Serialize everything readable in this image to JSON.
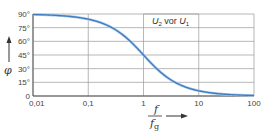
{
  "chart_data": {
    "type": "line",
    "title": "",
    "annotation": {
      "main": "U",
      "sub1": "2",
      "mid": " vor ",
      "main2": "U",
      "sub2": "1"
    },
    "xlabel": {
      "numerator": "f",
      "denominator": "f",
      "denominator_sub": "g"
    },
    "ylabel": "φ",
    "xscale": "log",
    "xlim": [
      0.01,
      100
    ],
    "ylim": [
      0,
      90
    ],
    "x_ticks": [
      0.01,
      0.1,
      1,
      10,
      100
    ],
    "x_tick_labels": [
      "0,01",
      "0,1",
      "1",
      "10",
      "100"
    ],
    "y_ticks": [
      0,
      15,
      30,
      45,
      60,
      75,
      90
    ],
    "y_tick_labels": [
      "0",
      "15°",
      "30°",
      "45°",
      "60°",
      "75°",
      "90°"
    ],
    "grid": true,
    "series": [
      {
        "name": "φ = arctan(fg/f)",
        "color": "#3d7cc0",
        "x": [
          0.01,
          0.02,
          0.05,
          0.1,
          0.2,
          0.3,
          0.5,
          0.7,
          1,
          1.5,
          2,
          3,
          5,
          7,
          10,
          20,
          50,
          100
        ],
        "y": [
          89.4,
          88.9,
          87.1,
          84.3,
          78.7,
          73.3,
          63.4,
          55.0,
          45.0,
          33.7,
          26.6,
          18.4,
          11.3,
          8.1,
          5.7,
          2.9,
          1.1,
          0.6
        ]
      }
    ]
  },
  "colors": {
    "curve": "#3d7cc0",
    "curve_halo": "#a9c8e8",
    "grid": "#9a9a9a",
    "axis": "#555555"
  }
}
